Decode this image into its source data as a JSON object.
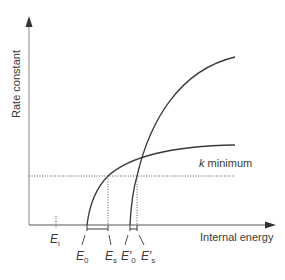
{
  "diagram": {
    "type": "rate-constant-vs-energy",
    "axes": {
      "y_label": "Rate constant",
      "x_label": "Internal energy"
    },
    "threshold_line": {
      "label_k": "k",
      "label_rest": " minimum",
      "style": "dotted"
    },
    "curves": [
      {
        "name": "k(E) curve 1 (lower onset, shallow)",
        "onset": "E0",
        "appearance": "Es"
      },
      {
        "name": "k(E) curve 2 (higher onset, steep)",
        "onset": "E'0",
        "appearance": "E's"
      }
    ],
    "markers": {
      "Ei": {
        "main": "E",
        "sub": "i"
      },
      "E0": {
        "main": "E",
        "sub": "0"
      },
      "Es": {
        "main": "E",
        "sub": "s"
      },
      "E0p": {
        "main": "E′",
        "sub": "0"
      },
      "Esp": {
        "main": "E′",
        "sub": "s"
      }
    },
    "colors": {
      "line": "#3a3a3a",
      "dotted": "#555555",
      "axis": "#8a8a8a"
    }
  }
}
